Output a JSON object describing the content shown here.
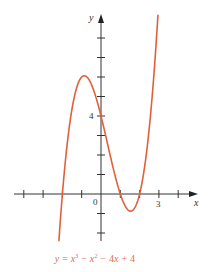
{
  "chart_data": {
    "type": "line",
    "title": "",
    "caption": "y = x³ − x² − 4x + 4",
    "function": {
      "coefficients": [
        1,
        -1,
        -4,
        4
      ],
      "expression": "y = x^3 - x^2 - 4x + 4"
    },
    "domain": [
      -2.18,
      2.95
    ],
    "xlabel": "x",
    "ylabel": "y",
    "xlim": [
      -4,
      5
    ],
    "ylim": [
      -2.5,
      9.5
    ],
    "x_ticks": [
      -4,
      -3,
      -2,
      -1,
      1,
      2,
      3,
      4
    ],
    "y_ticks": [
      -2,
      -1,
      1,
      2,
      3,
      4,
      5,
      6,
      7,
      8
    ],
    "tick_labels": {
      "x": [
        {
          "value": 3,
          "label": "3"
        }
      ],
      "y": [
        {
          "value": 4,
          "label": "4"
        }
      ],
      "origin": "0"
    },
    "key_points": {
      "x_intercepts": [
        -2,
        1,
        2
      ],
      "y_intercept": 4,
      "local_max": [
        -0.87,
        6.06
      ],
      "local_min": [
        1.54,
        -0.88
      ]
    },
    "grid": false,
    "series": [
      {
        "name": "y = x^3 - x^2 - 4x + 4",
        "color": "#e0603a"
      }
    ]
  },
  "labels": {
    "x_axis": "x",
    "y_axis": "y",
    "origin": "0",
    "x_tick_3": "3",
    "y_tick_4": "4"
  },
  "caption_parts": {
    "y": "y",
    "eq": " = ",
    "x1": "x",
    "p3": "3",
    "minus1": " − ",
    "x2": "x",
    "p2": "2",
    "rest": " − 4",
    "x3": "x",
    "tail": " + 4"
  },
  "colors": {
    "curve": "#e0603a",
    "axis": "#333333",
    "caption": "#e0704f"
  },
  "layout": {
    "origin_px": [
      101,
      194
    ],
    "unit_x_px": 19.3,
    "unit_y_px": 19.5
  }
}
